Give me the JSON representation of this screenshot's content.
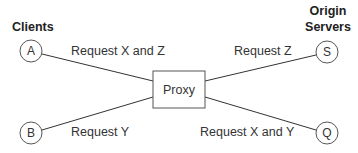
{
  "headers": {
    "clients": "Clients",
    "origin_line1": "Origin",
    "origin_line2": "Servers"
  },
  "proxy": {
    "label": "Proxy"
  },
  "nodes": {
    "a": "A",
    "b": "B",
    "s": "S",
    "q": "Q"
  },
  "edges": {
    "a_proxy": "Request X and Z",
    "b_proxy": "Request Y",
    "proxy_s": "Request Z",
    "proxy_q": "Request X and Y"
  }
}
